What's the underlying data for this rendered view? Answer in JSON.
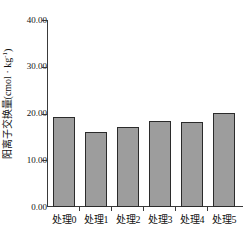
{
  "chart_data": {
    "type": "bar",
    "title": "",
    "xlabel": "",
    "ylabel": "阳离子交换量(cmol · kg-1)",
    "ylabel_base": "阳离子交换量(cmol · kg",
    "ylabel_exponent": "-1",
    "ylabel_tail": ")",
    "categories": [
      "处理0",
      "处理1",
      "处理2",
      "处理3",
      "处理4",
      "处理5"
    ],
    "values": [
      19.2,
      16.1,
      17.1,
      18.3,
      18.2,
      20.2
    ],
    "ylim": [
      0,
      40
    ],
    "ytick_labels": [
      "0.00",
      "10.00",
      "20.00",
      "30.00",
      "40.00"
    ],
    "ytick_values": [
      0,
      10,
      20,
      30,
      40
    ],
    "grid": false,
    "legend": "none",
    "bar_fill_color": "#9d9d9d",
    "bar_edge_color": "#2b2b2b",
    "axis_color": "#3a3a3a",
    "background_color": "#ffffff"
  },
  "axis": {
    "y_ticks": [
      {
        "label": "40.00",
        "value": 40
      },
      {
        "label": "30.00",
        "value": 30
      },
      {
        "label": "20.00",
        "value": 20
      },
      {
        "label": "10.00",
        "value": 10
      },
      {
        "label": "0.00",
        "value": 0
      }
    ],
    "x_ticks": [
      {
        "label": "处理0"
      },
      {
        "label": "处理1"
      },
      {
        "label": "处理2"
      },
      {
        "label": "处理3"
      },
      {
        "label": "处理4"
      },
      {
        "label": "处理5"
      }
    ]
  }
}
